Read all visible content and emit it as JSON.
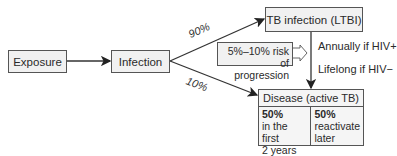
{
  "diagram": {
    "nodes": {
      "exposure": "Exposure",
      "infection": "Infection",
      "ltbi": "TB infection (LTBI)",
      "disease": "Disease (active TB)"
    },
    "edges": {
      "to_ltbi_pct": "90%",
      "to_disease_pct": "10%"
    },
    "risk_box": {
      "line1": "5%–10% risk of",
      "line2": "progression"
    },
    "risk_notes": {
      "hiv_pos": "Annually if HIV+",
      "hiv_neg": "Lifelong if HIV−"
    },
    "disease_split": {
      "left_pct": "50%",
      "left_line1": "in the first",
      "left_line2": "2 years",
      "right_pct": "50%",
      "right_line1": "reactivate",
      "right_line2": "later"
    },
    "colors": {
      "box_fill": "#f1f1f1",
      "stroke": "#333333",
      "text": "#2a2a2a"
    }
  }
}
